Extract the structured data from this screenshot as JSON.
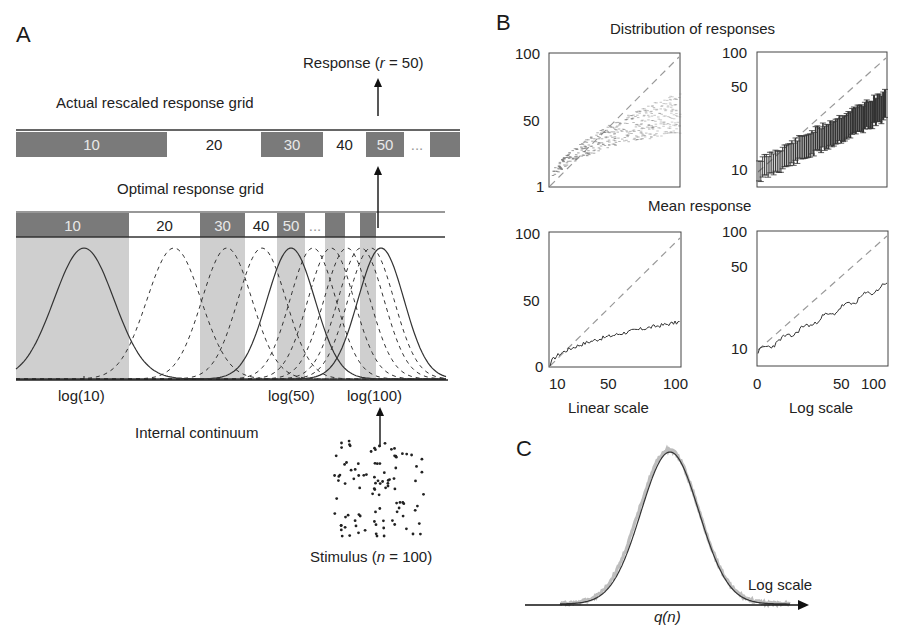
{
  "panel_a": {
    "letter": "A",
    "response_label": "Response (",
    "response_var": "r",
    "response_eq": " = 50)",
    "actual_grid_title": "Actual rescaled response grid",
    "optimal_grid_title": "Optimal response grid",
    "actual_grid": [
      {
        "x0": 16,
        "x1": 167,
        "dark": true,
        "label": "10"
      },
      {
        "x0": 167,
        "x1": 261,
        "dark": false,
        "label": "20"
      },
      {
        "x0": 261,
        "x1": 323,
        "dark": true,
        "label": "30"
      },
      {
        "x0": 323,
        "x1": 366,
        "dark": false,
        "label": "40"
      },
      {
        "x0": 366,
        "x1": 404,
        "dark": true,
        "label": "50"
      },
      {
        "x0": 404,
        "x1": 430,
        "dark": false,
        "label": "..."
      },
      {
        "x0": 430,
        "x1": 460,
        "dark": true,
        "label": ""
      }
    ],
    "optimal_grid": [
      {
        "x0": 16,
        "x1": 129,
        "dark": true,
        "label": "10"
      },
      {
        "x0": 129,
        "x1": 200,
        "dark": false,
        "label": "20"
      },
      {
        "x0": 200,
        "x1": 245,
        "dark": true,
        "label": "30"
      },
      {
        "x0": 245,
        "x1": 277,
        "dark": false,
        "label": "40"
      },
      {
        "x0": 277,
        "x1": 305,
        "dark": true,
        "label": "50"
      },
      {
        "x0": 305,
        "x1": 325,
        "dark": false,
        "label": "..."
      },
      {
        "x0": 325,
        "x1": 345,
        "dark": true,
        "label": ""
      },
      {
        "x0": 345,
        "x1": 360,
        "dark": false,
        "label": ""
      },
      {
        "x0": 360,
        "x1": 376,
        "dark": true,
        "label": ""
      }
    ],
    "gaussians": [
      {
        "mu": 84,
        "sigma": 30,
        "style": "solid"
      },
      {
        "mu": 174,
        "sigma": 27,
        "style": "dashed"
      },
      {
        "mu": 227,
        "sigma": 25,
        "style": "dashed"
      },
      {
        "mu": 262,
        "sigma": 24,
        "style": "dashed"
      },
      {
        "mu": 291,
        "sigma": 24,
        "style": "solid"
      },
      {
        "mu": 313,
        "sigma": 23,
        "style": "dashed"
      },
      {
        "mu": 331,
        "sigma": 23,
        "style": "dashed"
      },
      {
        "mu": 347,
        "sigma": 23,
        "style": "dashed"
      },
      {
        "mu": 361,
        "sigma": 23,
        "style": "dashed"
      },
      {
        "mu": 371,
        "sigma": 23,
        "style": "dashed"
      },
      {
        "mu": 381,
        "sigma": 23,
        "style": "solid"
      }
    ],
    "axis_labels": [
      {
        "x": 58,
        "text": "log(10)"
      },
      {
        "x": 268,
        "text": "log(50)"
      },
      {
        "x": 347,
        "text": "log(100)"
      }
    ],
    "continuum_label": "Internal continuum",
    "stimulus_label": "Stimulus (",
    "stimulus_var": "n",
    "stimulus_eq": " = 100)"
  },
  "panel_b": {
    "letter": "B",
    "top_title": "Distribution of responses",
    "bottom_title": "Mean response",
    "xlabel_left": "Linear scale",
    "xlabel_right": "Log scale"
  },
  "panel_c": {
    "letter": "C",
    "axis_label": "Log scale",
    "x_label": "q(n)"
  },
  "chart_data": [
    {
      "type": "scatter",
      "title": "Distribution of responses",
      "subtitle": "Linear scale",
      "xlabel": "",
      "ylabel": "",
      "yticks": [
        "1",
        "50",
        "100"
      ],
      "ylim": [
        1,
        100
      ],
      "xlim": [
        1,
        100
      ],
      "series": [
        {
          "name": "identity",
          "style": "dashed",
          "x": [
            1,
            100
          ],
          "y": [
            1,
            100
          ]
        },
        {
          "name": "response distribution",
          "x": [
            5,
            10,
            20,
            30,
            40,
            50,
            60,
            70,
            80,
            90,
            100
          ],
          "y": [
            5,
            9,
            14,
            18,
            21,
            24,
            26,
            28,
            30,
            31,
            33
          ]
        }
      ]
    },
    {
      "type": "scatter",
      "title": "Distribution of responses",
      "subtitle": "Log scale (error bars)",
      "yticks": [
        "10",
        "50",
        "100"
      ],
      "ylim": [
        7,
        100
      ],
      "xlim": [
        1,
        100
      ],
      "series": [
        {
          "name": "identity",
          "style": "dashed",
          "x": [
            1,
            100
          ],
          "y": [
            10,
            100
          ]
        },
        {
          "name": "mean with error bars",
          "x": [
            1,
            10,
            20,
            30,
            40,
            50,
            60,
            70,
            80,
            90,
            100
          ],
          "y": [
            9,
            11,
            13,
            15,
            17,
            19,
            22,
            24,
            27,
            29,
            32
          ]
        }
      ]
    },
    {
      "type": "line",
      "title": "Mean response",
      "xlabel": "Linear scale",
      "xticks": [
        "10",
        "50",
        "100"
      ],
      "yticks": [
        "0",
        "50",
        "100"
      ],
      "xlim": [
        0,
        100
      ],
      "ylim": [
        0,
        100
      ],
      "series": [
        {
          "name": "identity",
          "style": "dashed",
          "x": [
            0,
            100
          ],
          "y": [
            0,
            100
          ]
        },
        {
          "name": "mean response",
          "x": [
            0,
            5,
            10,
            20,
            30,
            40,
            50,
            60,
            70,
            80,
            90,
            100
          ],
          "y": [
            0,
            6,
            11,
            15,
            17,
            20,
            22,
            25,
            27,
            29,
            31,
            33
          ]
        }
      ]
    },
    {
      "type": "line",
      "title": "Mean response",
      "xlabel": "Log scale",
      "xticks": [
        "0",
        "50",
        "100"
      ],
      "yticks": [
        "10",
        "50",
        "100"
      ],
      "xlim": [
        1,
        100
      ],
      "ylim": [
        7,
        100
      ],
      "series": [
        {
          "name": "identity",
          "style": "dashed",
          "x": [
            1,
            100
          ],
          "y": [
            10,
            100
          ]
        },
        {
          "name": "mean response",
          "x": [
            1,
            5,
            10,
            20,
            30,
            40,
            50,
            60,
            70,
            80,
            90,
            100
          ],
          "y": [
            9,
            10,
            11,
            12,
            14,
            16,
            19,
            22,
            25,
            28,
            30,
            32
          ]
        }
      ]
    },
    {
      "type": "line",
      "title": "C",
      "xlabel": "q(n)",
      "axis_label": "Log scale",
      "series": [
        {
          "name": "empirical distribution",
          "style": "gray-noisy"
        },
        {
          "name": "gaussian fit",
          "style": "solid"
        }
      ]
    }
  ]
}
